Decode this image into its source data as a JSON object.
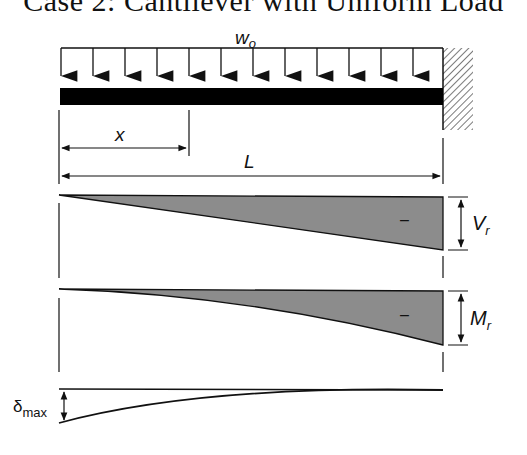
{
  "title": "Case 2: Cantilever with Uniform Load",
  "load": {
    "label": "w",
    "label_subscript": "o",
    "arrow_count": 12
  },
  "dimensions": {
    "x_label": "x",
    "L_label": "L"
  },
  "shear_diagram": {
    "sign": "–",
    "label": "V",
    "label_subscript": "r",
    "shape": "linear"
  },
  "moment_diagram": {
    "sign": "–",
    "label": "M",
    "label_subscript": "r",
    "shape": "parabolic"
  },
  "deflection_diagram": {
    "label": "δ",
    "label_subscript": "max",
    "shape": "curve"
  },
  "colors": {
    "diagram_fill": "#8c8c8c",
    "line": "#111111",
    "beam": "#000000"
  }
}
